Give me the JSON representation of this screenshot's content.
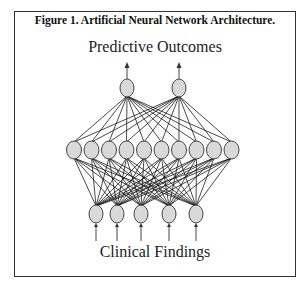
{
  "figure": {
    "title": "Figure 1. Artificial Neural Network Architecture.",
    "output_label": "Predictive Outcomes",
    "input_label": "Clinical Findings"
  },
  "network": {
    "layers": [
      {
        "name": "input",
        "count": 5,
        "y": 214,
        "x": [
          96,
          117,
          141,
          169,
          196
        ],
        "rx": 7,
        "ry": 9
      },
      {
        "name": "hidden",
        "count": 10,
        "y": 150,
        "x": [
          74,
          91.5,
          109,
          126.5,
          144,
          161.5,
          179,
          196.5,
          214,
          231.5
        ],
        "rx": 7.5,
        "ry": 9
      },
      {
        "name": "output",
        "count": 2,
        "y": 88,
        "x": [
          127,
          179
        ],
        "rx": 7,
        "ry": 9
      }
    ],
    "colors": {
      "node_fill": "#d9d9d9",
      "node_stroke": "#444444",
      "edge": "#1a1a1a"
    }
  }
}
